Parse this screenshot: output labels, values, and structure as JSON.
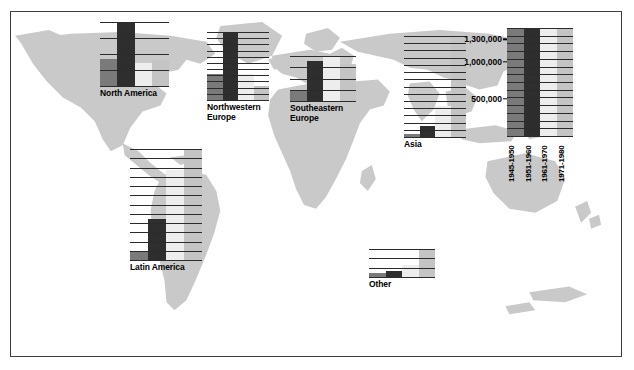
{
  "figure": {
    "title": "",
    "background_color": "#ffffff",
    "map_color": "#c9c9c9",
    "border_color": "#3c3c3c",
    "gridline_color": "#2b2b2b"
  },
  "chart_data": {
    "type": "bar",
    "title": "",
    "subtitle": "",
    "xlabel": "",
    "ylabel": "",
    "ylim": [
      0,
      1450000
    ],
    "grid": true,
    "legend_position": "right",
    "categories": [
      "1945-1950",
      "1951-1960",
      "1961-1970",
      "1971-1980"
    ],
    "series_colors": [
      "#7a7a7a",
      "#2e2e2e",
      "#ededed",
      "#c4c4c4"
    ],
    "yticks": [
      500000,
      1000000,
      1300000
    ],
    "ytick_labels": [
      "500,000",
      "1,000,000",
      "1,300,000"
    ],
    "panels": [
      {
        "name": "North America",
        "label": "North America",
        "values": [
          180000,
          420000,
          150000,
          170000
        ]
      },
      {
        "name": "Northwestern Europe",
        "label": "Northwestern\nEurope",
        "values": [
          430000,
          1130000,
          430000,
          230000
        ]
      },
      {
        "name": "Southeastern Europe",
        "label": "Southeastern\nEurope",
        "values": [
          100000,
          360000,
          400000,
          330000
        ]
      },
      {
        "name": "Asia",
        "label": "Asia",
        "values": [
          35000,
          150000,
          430000,
          1400000
        ]
      },
      {
        "name": "Latin America",
        "label": "Latin America",
        "values": [
          100000,
          450000,
          1000000,
          1230000
        ]
      },
      {
        "name": "Other",
        "label": "Other",
        "values": [
          12000,
          20000,
          40000,
          90000
        ]
      }
    ]
  },
  "legend": {
    "name": "scale-legend",
    "ytick_labels": [
      "1,300,000",
      "1,000,000",
      "500,000"
    ],
    "periods": [
      "1945-1950",
      "1951-1960",
      "1961-1970",
      "1971-1980"
    ]
  }
}
